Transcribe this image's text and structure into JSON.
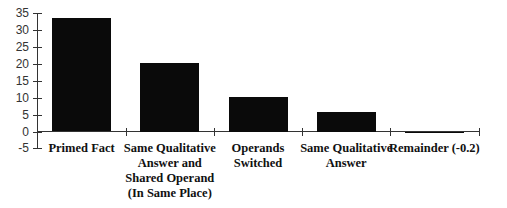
{
  "chart_data": {
    "type": "bar",
    "title": "",
    "xlabel": "",
    "ylabel": "",
    "ylim": [
      -5,
      35
    ],
    "yticks": [
      35,
      30,
      25,
      20,
      15,
      10,
      5,
      0,
      -5
    ],
    "grid": false,
    "legend": null,
    "categories": [
      "Primed Fact",
      "Same Qualitative Answer and Shared Operand (In Same Place)",
      "Operands Switched",
      "Same Qualitative Answer",
      "Remainder (-0.2)"
    ],
    "category_display": [
      "Primed Fact",
      "Same Qualitative\nAnswer and\nShared Operand\n(In Same Place)",
      "Operands\nSwitched",
      "Same Qualitative\nAnswer",
      "Remainder (-0.2)"
    ],
    "values": [
      33.5,
      20.3,
      10.3,
      5.8,
      -0.2
    ],
    "bar_color": "#0a0a0a"
  }
}
